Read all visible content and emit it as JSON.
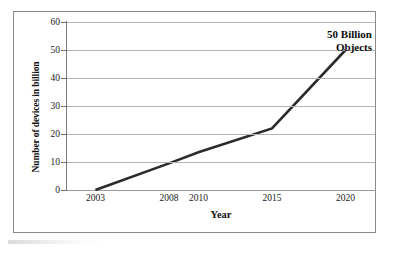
{
  "chart_data": {
    "type": "line",
    "title": "",
    "xlabel": "Year",
    "ylabel": "Number of devices in billion",
    "categories": [
      "2003",
      "2008",
      "2010",
      "2015",
      "2020"
    ],
    "x": [
      2003,
      2008,
      2010,
      2015,
      2020
    ],
    "values": [
      0,
      9.5,
      13.5,
      22,
      50
    ],
    "series": [
      {
        "name": "Number of devices in billion",
        "values": [
          0,
          9.5,
          13.5,
          22,
          50
        ]
      }
    ],
    "xlim": [
      2001,
      2022
    ],
    "ylim": [
      0,
      60
    ],
    "yticks": [
      0,
      10,
      20,
      30,
      40,
      50,
      60
    ],
    "ytick_labels": [
      "0",
      "10",
      "20",
      "30",
      "40",
      "50",
      "60"
    ],
    "xtick_labels": [
      "2003",
      "2008",
      "2010",
      "2015",
      "2020"
    ],
    "grid": "horizontal",
    "legend": "none",
    "annotations": [
      {
        "text_line_1": "50 Billion",
        "text_line_2": "Objects",
        "at_x": 2020,
        "at_y": 50
      }
    ],
    "colors": {
      "line": "#2b2b2b",
      "gridline": "#b3b3b3",
      "axis": "#7d7d7d",
      "frame": "#8a8a8a",
      "text": "#101010",
      "background": "#ffffff"
    }
  }
}
